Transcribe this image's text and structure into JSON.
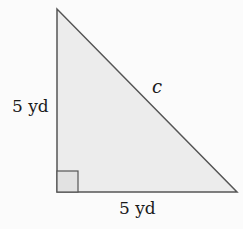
{
  "diagram": {
    "type": "right-triangle",
    "vertices": {
      "top": [
        57,
        9
      ],
      "right_angle": [
        57,
        192
      ],
      "right": [
        237,
        192
      ]
    },
    "right_angle_marker_size": 21,
    "fill_color": "#ececec",
    "stroke_color": "#555555",
    "labels": {
      "vertical_leg": "5 yd",
      "horizontal_leg": "5 yd",
      "hypotenuse": "c"
    }
  }
}
